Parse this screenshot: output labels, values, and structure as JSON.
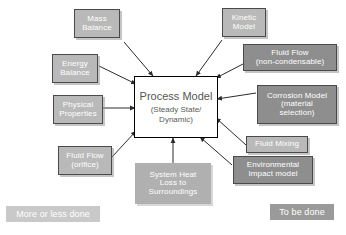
{
  "diagram": {
    "title": "Process Model",
    "canvas": {
      "width": 346,
      "height": 235,
      "background": "#ffffff"
    },
    "center": {
      "title": "Process Model",
      "subtitle_line1": "(Steady State/",
      "subtitle_line2": "Dynamic)",
      "fill": "#ffffff",
      "border": "#000000"
    },
    "status_colors": {
      "done_fill": "#b9b9b9",
      "todo_fill": "#8e8e8e",
      "soft_fill": "#b0b0b0",
      "legend_done_fill": "#c9c9c9",
      "legend_todo_fill": "#9a9a9a",
      "border": "#4a4a4a",
      "text": "#ffffff"
    },
    "nodes": [
      {
        "id": "mass-balance",
        "status": "done",
        "lines": [
          "Mass",
          "Balance"
        ]
      },
      {
        "id": "kinetic-model",
        "status": "done",
        "lines": [
          "Kinetic",
          "Model"
        ]
      },
      {
        "id": "fluid-flow-non-condensable",
        "status": "todo",
        "lines": [
          "Fluid Flow",
          "(non-condensable)"
        ]
      },
      {
        "id": "energy-balance",
        "status": "done",
        "lines": [
          "Energy",
          "Balance"
        ]
      },
      {
        "id": "corrosion-model",
        "status": "todo",
        "lines": [
          "Corrosion Model",
          "(material",
          "selection)"
        ]
      },
      {
        "id": "physical-properties",
        "status": "done",
        "lines": [
          "Physical",
          "Properties"
        ]
      },
      {
        "id": "fluid-mixing",
        "status": "done",
        "lines": [
          "Fluid Mixing"
        ]
      },
      {
        "id": "fluid-flow-orifice",
        "status": "done",
        "lines": [
          "Fluid Flow",
          "(orifice)"
        ]
      },
      {
        "id": "system-heat-loss",
        "status": "soft",
        "lines": [
          "System Heat",
          "Loss to",
          "Surroundings"
        ]
      },
      {
        "id": "environmental-impact-model",
        "status": "todo",
        "lines": [
          "Environmental",
          "Impact model"
        ]
      }
    ],
    "legend": {
      "done_label": "More or less done",
      "todo_label": "To be done"
    }
  }
}
